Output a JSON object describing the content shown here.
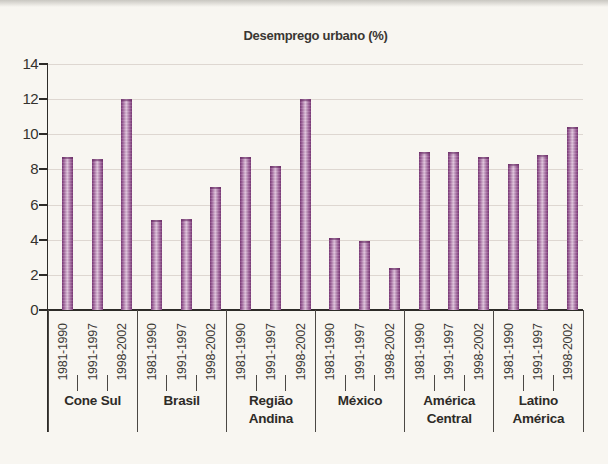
{
  "figure": {
    "title": "Desemprego urbano (%)"
  },
  "chart_data": {
    "type": "bar",
    "title": "Desemprego urbano (%)",
    "ylim": [
      0,
      14
    ],
    "yticks": [
      0,
      2,
      4,
      6,
      8,
      10,
      12,
      14
    ],
    "grid": true,
    "legend": "none",
    "period_labels": [
      "1981-1990",
      "1991-1997",
      "1998-2002"
    ],
    "groups": [
      {
        "label": "Cone Sul",
        "label_lines": [
          "Cone Sul"
        ],
        "values": [
          8.7,
          8.6,
          12.0
        ]
      },
      {
        "label": "Brasil",
        "label_lines": [
          "Brasil"
        ],
        "values": [
          5.1,
          5.2,
          7.0
        ]
      },
      {
        "label": "Região Andina",
        "label_lines": [
          "Região",
          "Andina"
        ],
        "values": [
          8.7,
          8.2,
          12.0
        ]
      },
      {
        "label": "México",
        "label_lines": [
          "México"
        ],
        "values": [
          4.1,
          3.9,
          2.4
        ]
      },
      {
        "label": "América Central",
        "label_lines": [
          "América",
          "Central"
        ],
        "values": [
          9.0,
          9.0,
          8.7
        ]
      },
      {
        "label": "Latino América",
        "label_lines": [
          "Latino",
          "América"
        ],
        "values": [
          8.3,
          8.8,
          10.4
        ]
      }
    ],
    "colors": {
      "bar_dark": "#7e3b7a",
      "bar_mid": "#a1669d",
      "bar_light": "#e0c3dc",
      "grid": "#ded7d1",
      "axis": "#2d2b28",
      "background": "#f8f6f1",
      "text": "#35322e"
    }
  }
}
